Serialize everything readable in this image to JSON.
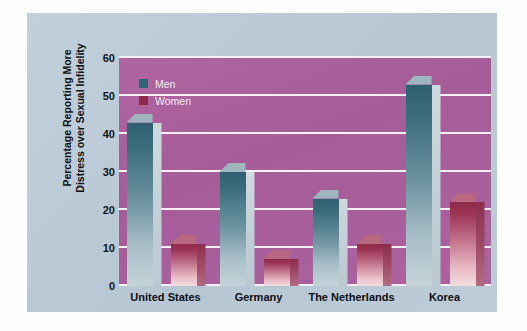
{
  "chart_data": {
    "type": "bar",
    "title": "",
    "subtitle": "",
    "xlabel": "",
    "ylabel": "Percentage Reporting More Distress over Sexual Infidelity",
    "ylabel_line1": "Percentage Reporting More",
    "ylabel_line2": "Distress over Sexual Infidelity",
    "categories": [
      "United States",
      "Germany",
      "The Netherlands",
      "Korea"
    ],
    "series": [
      {
        "name": "Men",
        "values": [
          43,
          30,
          23,
          53
        ],
        "color": "#2d6478"
      },
      {
        "name": "Women",
        "values": [
          11,
          7,
          11,
          22
        ],
        "color": "#8e2a4a"
      }
    ],
    "ylim": [
      0,
      60
    ],
    "ytick_values": [
      0,
      10,
      20,
      30,
      40,
      50,
      60
    ],
    "ytick_labels": [
      "0",
      "10",
      "20",
      "30",
      "40",
      "50",
      "60"
    ],
    "grid": true,
    "grid_color": "#f4f0f6",
    "legend_position": "top-left",
    "plot_background": "#a9609c",
    "panel_background": "#bccbd7"
  },
  "legend": {
    "items": [
      {
        "label": "Men"
      },
      {
        "label": "Women"
      }
    ]
  },
  "axis": {
    "y_title_line1": "Percentage Reporting More",
    "y_title_line2": "Distress over Sexual Infidelity"
  }
}
